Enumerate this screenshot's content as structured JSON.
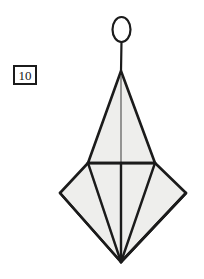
{
  "figure": {
    "background_color": "#ffffff",
    "stroke_color": "#1b1b1b",
    "thin_stroke_color": "#4a4a4a",
    "fill_color": "#eeeeec",
    "label": {
      "name": "figure-index-label",
      "value": "10",
      "border_color": "#1b1b1b",
      "background_color": "#ffffff",
      "x": 13,
      "y": 65,
      "width": 24,
      "height": 20
    },
    "parts": [
      {
        "name": "head-ellipse",
        "shape": "ellipse",
        "cx": 121.5,
        "cy": 29.5,
        "rx": 9,
        "ry": 12.5,
        "fill": "#ffffff",
        "stroke_width": 2.2
      },
      {
        "name": "neck-stem",
        "shape": "line",
        "x1": 121.5,
        "y1": 42,
        "x2": 121,
        "y2": 71,
        "stroke_width": 2.2
      },
      {
        "name": "upper-triangle",
        "shape": "polygon",
        "points": "121,71 155,163 88,163",
        "fill": "#eeeeec",
        "stroke_width": 2.6
      },
      {
        "name": "upper-triangle-center-line",
        "shape": "line",
        "x1": 121,
        "y1": 76,
        "x2": 121,
        "y2": 162,
        "stroke_width": 1.1
      },
      {
        "name": "lower-kite",
        "shape": "polygon",
        "points": "88,163 155,163 186,193 121,262 60,193",
        "fill": "#eeeeec",
        "stroke_width": 2.6
      },
      {
        "name": "kite-rib-left-outer",
        "shape": "line",
        "x1": 60,
        "y1": 193,
        "x2": 121,
        "y2": 262,
        "stroke_width": 2.6
      },
      {
        "name": "kite-rib-left-inner",
        "shape": "line",
        "x1": 88,
        "y1": 163,
        "x2": 121,
        "y2": 262,
        "stroke_width": 2.4
      },
      {
        "name": "kite-rib-center",
        "shape": "line",
        "x1": 121,
        "y1": 163,
        "x2": 121,
        "y2": 262,
        "stroke_width": 2.4
      },
      {
        "name": "kite-rib-right-inner",
        "shape": "line",
        "x1": 155,
        "y1": 163,
        "x2": 121,
        "y2": 262,
        "stroke_width": 2.4
      },
      {
        "name": "kite-rib-right-outer",
        "shape": "line",
        "x1": 186,
        "y1": 193,
        "x2": 121,
        "y2": 262,
        "stroke_width": 2.6
      },
      {
        "name": "horizontal-crossbar",
        "shape": "line",
        "x1": 88,
        "y1": 163,
        "x2": 155,
        "y2": 163,
        "stroke_width": 2.6
      }
    ]
  }
}
